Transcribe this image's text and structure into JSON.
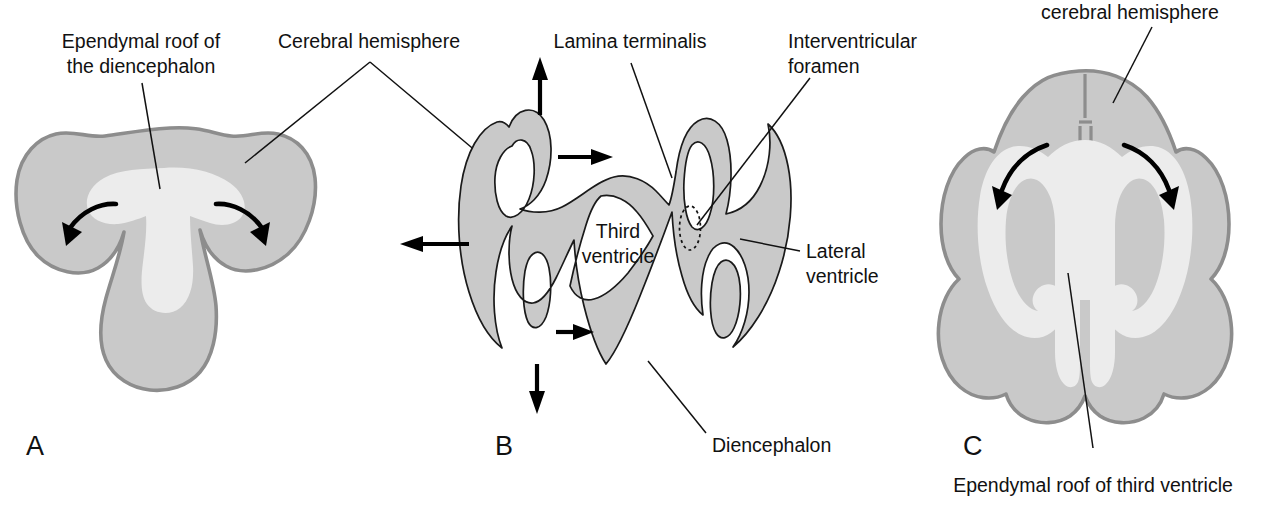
{
  "figure": {
    "background_color": "#ffffff",
    "colors": {
      "brain_tissue": "#c9c9c9",
      "ventricle_lumen": "#ececec",
      "tissue_outline": "#8d8d8d",
      "ribbon_outline": "#1a1a1a",
      "arrow": "#000000",
      "text": "#111111"
    }
  },
  "panels": [
    {
      "letter": "A",
      "name": "panel-a",
      "description": "Coronal section of early forebrain showing T-shaped ventricle and ependymal roof of the diencephalon",
      "labels": [
        {
          "id": "ependymal-roof-diencephalon",
          "text_lines": [
            "Ependymal roof of",
            "the diencephalon"
          ]
        }
      ],
      "arrows": [
        {
          "id": "growth-arrow-left",
          "direction": "down-left",
          "style": "curved"
        },
        {
          "id": "growth-arrow-right",
          "direction": "down-right",
          "style": "curved"
        }
      ]
    },
    {
      "letter": "B",
      "name": "panel-b",
      "description": "Schematic of the folded ventricular wall showing expansion directions of the cerebral hemispheres",
      "labels": [
        {
          "id": "lamina-terminalis",
          "text_lines": [
            "Lamina terminalis"
          ]
        },
        {
          "id": "interventricular-foramen",
          "text_lines": [
            "Interventricular",
            "foramen"
          ]
        },
        {
          "id": "third-ventricle",
          "text_lines": [
            "Third",
            "ventricle"
          ]
        },
        {
          "id": "lateral-ventricle",
          "text_lines": [
            "Lateral",
            "ventricle"
          ]
        },
        {
          "id": "diencephalon",
          "text_lines": [
            "Diencephalon"
          ]
        }
      ],
      "arrows": [
        {
          "id": "expansion-arrow-up",
          "direction": "up",
          "style": "straight"
        },
        {
          "id": "expansion-arrow-right-upper",
          "direction": "right",
          "style": "straight"
        },
        {
          "id": "expansion-arrow-left",
          "direction": "left",
          "style": "straight"
        },
        {
          "id": "expansion-arrow-right-lower",
          "direction": "right",
          "style": "straight"
        },
        {
          "id": "expansion-arrow-down",
          "direction": "down",
          "style": "straight"
        }
      ],
      "markers": [
        {
          "id": "foramen-marker",
          "shape": "dotted-ellipse"
        }
      ]
    },
    {
      "letter": "C",
      "name": "panel-c",
      "description": "Later coronal section with enlarged cerebral hemispheres and C-shaped lateral ventricles",
      "labels": [
        {
          "id": "cerebral-hemisphere-c",
          "text_lines": [
            "cerebral hemisphere"
          ]
        },
        {
          "id": "ependymal-roof-third-ventricle",
          "text_lines": [
            "Ependymal roof of third ventricle"
          ]
        }
      ],
      "arrows": [
        {
          "id": "growth-arrow-left-c",
          "direction": "down-left",
          "style": "curved"
        },
        {
          "id": "growth-arrow-right-c",
          "direction": "down-right",
          "style": "curved"
        }
      ]
    }
  ],
  "shared_labels": [
    {
      "id": "cerebral-hemisphere",
      "text_lines": [
        "Cerebral hemisphere"
      ],
      "points_to": [
        "panel-a",
        "panel-b"
      ]
    }
  ],
  "text": {
    "ependymal_roof_diencephalon_l1": "Ependymal roof of",
    "ependymal_roof_diencephalon_l2": "the diencephalon",
    "cerebral_hemisphere": "Cerebral hemisphere",
    "lamina_terminalis": "Lamina terminalis",
    "interventricular_foramen_l1": "Interventricular",
    "interventricular_foramen_l2": "foramen",
    "third_ventricle_l1": "Third",
    "third_ventricle_l2": "ventricle",
    "lateral_ventricle_l1": "Lateral",
    "lateral_ventricle_l2": "ventricle",
    "diencephalon": "Diencephalon",
    "cerebral_hemisphere_c": "cerebral hemisphere",
    "ependymal_roof_third_ventricle": "Ependymal roof of third ventricle",
    "panel_a": "A",
    "panel_b": "B",
    "panel_c": "C"
  }
}
